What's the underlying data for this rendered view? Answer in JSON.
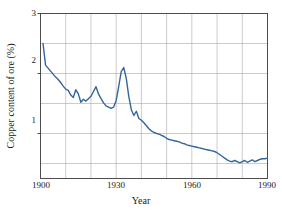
{
  "chart_data": {
    "type": "line",
    "title": "",
    "xlabel": "Year",
    "ylabel": "Copper content of ore (%)",
    "xlim": [
      1900,
      1990
    ],
    "ylim": [
      0.25,
      3
    ],
    "xticks": [
      1900,
      1930,
      1960,
      1990
    ],
    "xtick_labels": [
      "1900",
      "1930",
      "1960",
      "1990"
    ],
    "yticks": [
      1,
      2,
      3
    ],
    "ytick_labels": [
      "1",
      "2",
      "3"
    ],
    "grid": true,
    "grid_x_step": 10,
    "grid_y_step": 0.5,
    "grid_color": "#a8a8a8",
    "frame_color": "#4d4d4d",
    "legend": null,
    "series": [
      {
        "name": "Copper content of ore",
        "color": "#35659e",
        "line_width": 1.4,
        "x": [
          1901,
          1902,
          1903,
          1904,
          1905,
          1906,
          1907,
          1908,
          1909,
          1910,
          1911,
          1912,
          1913,
          1914,
          1915,
          1916,
          1917,
          1918,
          1919,
          1920,
          1921,
          1922,
          1923,
          1924,
          1925,
          1926,
          1927,
          1928,
          1929,
          1930,
          1931,
          1932,
          1933,
          1934,
          1935,
          1936,
          1937,
          1938,
          1939,
          1940,
          1941,
          1942,
          1943,
          1944,
          1945,
          1946,
          1947,
          1948,
          1949,
          1950,
          1951,
          1952,
          1953,
          1954,
          1955,
          1956,
          1957,
          1958,
          1959,
          1960,
          1961,
          1962,
          1963,
          1964,
          1965,
          1966,
          1967,
          1968,
          1969,
          1970,
          1971,
          1972,
          1973,
          1974,
          1975,
          1976,
          1977,
          1978,
          1979,
          1980,
          1981,
          1982,
          1983,
          1984,
          1985,
          1986,
          1987,
          1988,
          1989,
          1990
        ],
        "y": [
          2.5,
          2.14,
          2.09,
          2.04,
          1.99,
          1.94,
          1.9,
          1.85,
          1.79,
          1.74,
          1.72,
          1.64,
          1.6,
          1.73,
          1.66,
          1.52,
          1.57,
          1.54,
          1.58,
          1.62,
          1.7,
          1.78,
          1.66,
          1.58,
          1.51,
          1.46,
          1.44,
          1.42,
          1.44,
          1.55,
          1.78,
          2.03,
          2.1,
          1.92,
          1.62,
          1.4,
          1.3,
          1.37,
          1.25,
          1.22,
          1.18,
          1.13,
          1.08,
          1.04,
          1.02,
          1.0,
          0.99,
          0.97,
          0.95,
          0.92,
          0.9,
          0.89,
          0.88,
          0.87,
          0.86,
          0.84,
          0.83,
          0.81,
          0.8,
          0.79,
          0.78,
          0.77,
          0.76,
          0.75,
          0.74,
          0.73,
          0.72,
          0.71,
          0.7,
          0.68,
          0.65,
          0.62,
          0.59,
          0.56,
          0.54,
          0.53,
          0.55,
          0.53,
          0.51,
          0.53,
          0.55,
          0.52,
          0.54,
          0.56,
          0.53,
          0.55,
          0.57,
          0.58,
          0.58,
          0.59
        ]
      }
    ]
  },
  "axes": {
    "x_title": "Year",
    "y_title": "Copper content of ore (%)",
    "x_tick_labels": [
      "1900",
      "1930",
      "1960",
      "1990"
    ],
    "y_tick_labels": [
      "3",
      "2",
      "1"
    ]
  }
}
